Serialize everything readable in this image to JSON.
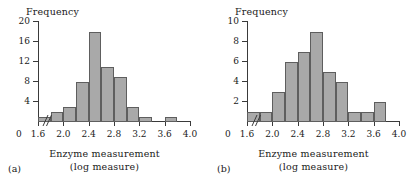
{
  "figure": {
    "panels": [
      {
        "tag": "(a)",
        "ylabel": "Frequency",
        "xlabel_line1": "Enzyme measurement",
        "xlabel_line2": "(log measure)",
        "origin_label": "0",
        "yticks": [
          "4",
          "8",
          "12",
          "16",
          "20"
        ],
        "xticks": [
          "1.6",
          "2.0",
          "2.4",
          "2.8",
          "3.2",
          "3.6",
          "4.0"
        ]
      },
      {
        "tag": "(b)",
        "ylabel": "Frequency",
        "xlabel_line1": "Enzyme measurement",
        "xlabel_line2": "(log measure)",
        "origin_label": "0",
        "yticks": [
          "2",
          "4",
          "6",
          "8",
          "10"
        ],
        "xticks": [
          "1.6",
          "2.0",
          "2.4",
          "2.8",
          "3.2",
          "3.6",
          "4.0"
        ]
      }
    ],
    "colors": {
      "bar_fill": "#a9a9a9",
      "bar_border": "#5e5e5e",
      "axis": "#3a3a3a",
      "text": "#1a1a1a",
      "background": "#ffffff"
    }
  },
  "chart_data": [
    {
      "type": "bar",
      "title": "(a)",
      "xlabel": "Enzyme measurement (log measure)",
      "ylabel": "Frequency",
      "xlim": [
        1.6,
        4.0
      ],
      "ylim": [
        0,
        20
      ],
      "yticks": [
        4,
        8,
        12,
        16,
        20
      ],
      "xticks": [
        1.6,
        2.0,
        2.4,
        2.8,
        3.2,
        3.6,
        4.0
      ],
      "grid": false,
      "legend": "none",
      "axis_break": true,
      "bin_width": 0.2,
      "bin_edges": [
        1.6,
        1.8,
        2.0,
        2.2,
        2.4,
        2.6,
        2.8,
        3.0,
        3.2,
        3.4,
        3.6,
        3.8
      ],
      "categories": [
        "1.6-1.8",
        "1.8-2.0",
        "2.0-2.2",
        "2.2-2.4",
        "2.4-2.6",
        "2.6-2.8",
        "2.8-3.0",
        "3.0-3.2",
        "3.2-3.4",
        "3.4-3.6",
        "3.6-3.8"
      ],
      "values": [
        1,
        2,
        3,
        8,
        18,
        11,
        9,
        3,
        1,
        0,
        1
      ]
    },
    {
      "type": "bar",
      "title": "(b)",
      "xlabel": "Enzyme measurement (log measure)",
      "ylabel": "Frequency",
      "xlim": [
        1.6,
        4.0
      ],
      "ylim": [
        0,
        10
      ],
      "yticks": [
        2,
        4,
        6,
        8,
        10
      ],
      "xticks": [
        1.6,
        2.0,
        2.4,
        2.8,
        3.2,
        3.6,
        4.0
      ],
      "grid": false,
      "legend": "none",
      "axis_break": true,
      "bin_width": 0.2,
      "bin_edges": [
        1.6,
        1.8,
        2.0,
        2.2,
        2.4,
        2.6,
        2.8,
        3.0,
        3.2,
        3.4,
        3.6,
        3.8
      ],
      "categories": [
        "1.6-1.8",
        "1.8-2.0",
        "2.0-2.2",
        "2.2-2.4",
        "2.4-2.6",
        "2.6-2.8",
        "2.8-3.0",
        "3.0-3.2",
        "3.2-3.4",
        "3.4-3.6",
        "3.6-3.8"
      ],
      "values": [
        1,
        1,
        3,
        6,
        7,
        9,
        5,
        4,
        1,
        1,
        2
      ]
    }
  ]
}
